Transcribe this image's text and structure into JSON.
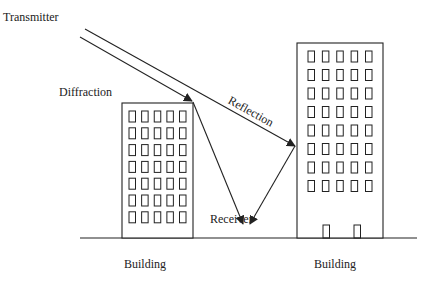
{
  "diagram": {
    "labels": {
      "transmitter": "Transmitter",
      "diffraction": "Diffraction",
      "reflection": "Reflection",
      "receiver": "Receiver",
      "building_left": "Building",
      "building_right": "Building"
    },
    "colors": {
      "line": "#222222",
      "background": "#ffffff"
    },
    "buildings": [
      {
        "name": "left",
        "x": 122,
        "y": 103,
        "w": 71,
        "h": 135,
        "window_rows": 7,
        "window_cols": 5,
        "doors": 0
      },
      {
        "name": "right",
        "x": 297,
        "y": 43,
        "w": 86,
        "h": 195,
        "window_rows": 8,
        "window_cols": 5,
        "doors": 2
      }
    ],
    "rays": [
      {
        "name": "direct-to-reflection",
        "from": [
          85,
          29
        ],
        "to": [
          295,
          146
        ]
      },
      {
        "name": "direct-to-diffraction",
        "from": [
          80,
          37
        ],
        "to": [
          192,
          101
        ]
      },
      {
        "name": "diffracted",
        "from": [
          193,
          102
        ],
        "to": [
          243,
          224
        ]
      },
      {
        "name": "reflected",
        "from": [
          295,
          146
        ],
        "to": [
          250,
          224
        ]
      }
    ],
    "ground": {
      "x1": 80,
      "x2": 417,
      "y": 238
    }
  }
}
